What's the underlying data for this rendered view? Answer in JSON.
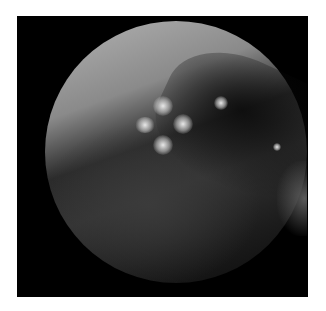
{
  "image": {
    "description": "Grayscale endoscopic view in a circular field on black background with white border",
    "colors": {
      "border": "#ffffff",
      "background": "#000000",
      "bright_region": "#b3b3b3",
      "mid_tissue": "#3a3a3a"
    },
    "highlights": [
      {
        "x": 163,
        "y": 106,
        "r": 10
      },
      {
        "x": 145,
        "y": 127,
        "r": 10
      },
      {
        "x": 183,
        "y": 124,
        "r": 10
      },
      {
        "x": 163,
        "y": 145,
        "r": 10
      },
      {
        "x": 221,
        "y": 103,
        "r": 7
      },
      {
        "x": 277,
        "y": 146,
        "r": 4
      }
    ]
  }
}
